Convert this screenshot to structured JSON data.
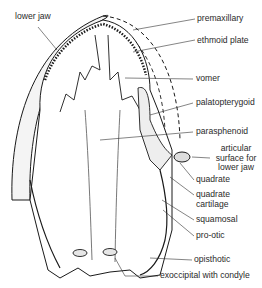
{
  "figure": {
    "ink_color": "#1a1a1a",
    "background": "#ffffff"
  },
  "labels": {
    "lower_jaw": "lower jaw",
    "premaxillary": "premaxillary",
    "ethmoid_plate": "ethmoid plate",
    "vomer": "vomer",
    "palatopterygoid": "palatopterygoid",
    "parasphenoid": "parasphenoid",
    "articular_1": "articular",
    "articular_2": "surface for",
    "articular_3": "lower jaw",
    "quadrate": "quadrate",
    "quadrate_cartilage_1": "quadrate",
    "quadrate_cartilage_2": "cartilage",
    "squamosal": "squamosal",
    "pro_otic": "pro-otic",
    "opisthotic": "opisthotic",
    "exoccipital": "exoccipital with condyle"
  }
}
